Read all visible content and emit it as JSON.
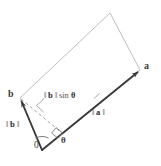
{
  "figure": {
    "background_color": "#ffffff",
    "outline_color": "#b9b9b9",
    "vector_color": "#404040",
    "dashed_color": "#8a8a8a",
    "text_color": "#4a4a4a"
  },
  "labels": {
    "vector_a_name": "a",
    "vector_b_name": "b",
    "origin": "0",
    "theta": "θ",
    "norm_a_bar_left": "‖",
    "norm_a_symbol": "a",
    "norm_a_bar_right": "‖",
    "norm_b_bar_left": "‖",
    "norm_b_symbol": "b",
    "norm_b_bar_right": "‖",
    "height_bar_left": "‖",
    "height_symbol": "b",
    "height_bar_right": "‖",
    "height_trig": "sin",
    "height_angle": "θ"
  },
  "geometry": {
    "origin_point": [
      42,
      150
    ],
    "vector_a_tip": [
      140,
      70
    ],
    "vector_b_tip": [
      20,
      98
    ],
    "parallelogram_far_corner": [
      110,
      13
    ],
    "perpendicular_foot": [
      62,
      133
    ],
    "right_angle_marker": [
      57,
      129
    ],
    "angle_arc_radius": 15
  }
}
